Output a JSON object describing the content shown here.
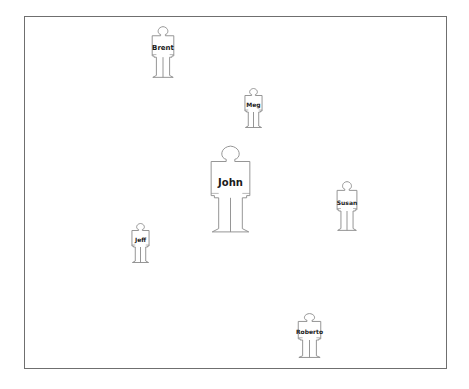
{
  "diagram": {
    "stroke_color": "#8a8a8a",
    "people": [
      {
        "name": "Brent",
        "x": 151,
        "y": 26,
        "w": 24,
        "h": 52,
        "font": 7,
        "focus": false
      },
      {
        "name": "Meg",
        "x": 244,
        "y": 88,
        "w": 19,
        "h": 40,
        "font": 6,
        "focus": false
      },
      {
        "name": "John",
        "x": 209,
        "y": 145,
        "w": 43,
        "h": 88,
        "font": 10,
        "focus": true
      },
      {
        "name": "Susan",
        "x": 336,
        "y": 181,
        "w": 22,
        "h": 50,
        "font": 6,
        "focus": false
      },
      {
        "name": "Jeff",
        "x": 131,
        "y": 223,
        "w": 19,
        "h": 40,
        "font": 6,
        "focus": false
      },
      {
        "name": "Roberto",
        "x": 297,
        "y": 313,
        "w": 25,
        "h": 45,
        "font": 6,
        "focus": false
      }
    ]
  }
}
